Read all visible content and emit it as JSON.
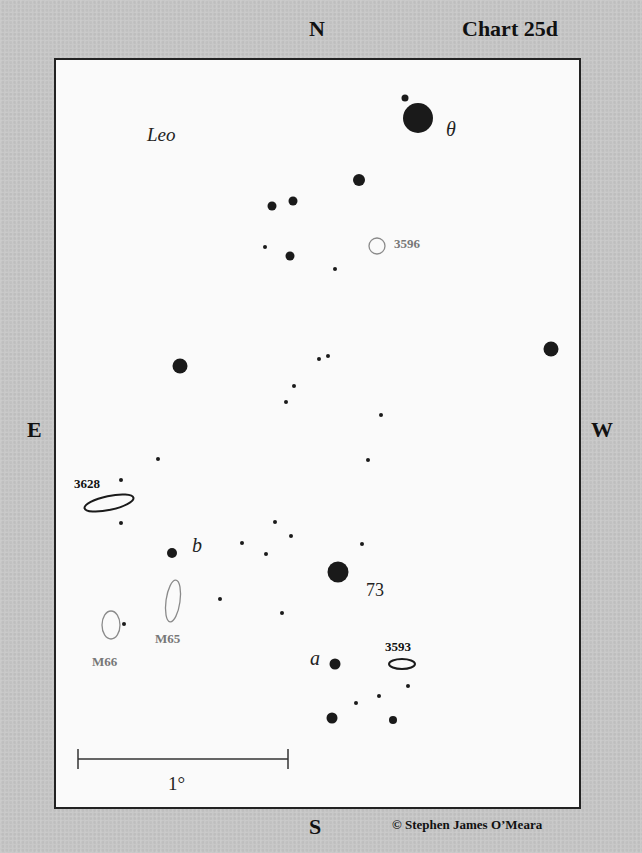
{
  "header": {
    "direction_north": "N",
    "chart_title": "Chart 25d"
  },
  "sides": {
    "direction_east": "E",
    "direction_west": "W",
    "direction_south": "S"
  },
  "footer": {
    "copyright": "© Stephen James O’Meara"
  },
  "chart": {
    "constellation_label": "Leo",
    "scale_bar_label": "1°",
    "colors": {
      "star": "#1a1a1a",
      "bright_galaxy_outline": "#1a1a1a",
      "faint_object_outline": "#8a8a8a",
      "faint_label": "#777777",
      "background": "#fafafa",
      "outer_background": "#c8c8c8"
    },
    "star_labels": [
      {
        "id": "theta",
        "text": "θ",
        "x": 446,
        "y": 135
      },
      {
        "id": "73",
        "text": "73",
        "x": 366,
        "y": 597
      },
      {
        "id": "b",
        "text": "b",
        "x": 192,
        "y": 551
      },
      {
        "id": "a",
        "text": "a",
        "x": 310,
        "y": 664
      }
    ],
    "objects": [
      {
        "id": "NGC3596",
        "label": "3596",
        "type": "galaxy-faint",
        "cx": 375,
        "cy": 244,
        "rx": 8,
        "ry": 8,
        "rotate": 0,
        "label_x": 394,
        "label_y": 248
      },
      {
        "id": "NGC3628",
        "label": "3628",
        "type": "galaxy-bright",
        "cx": 107,
        "cy": 501,
        "rx": 25,
        "ry": 7,
        "rotate": -12,
        "label_x": 74,
        "label_y": 488
      },
      {
        "id": "M65",
        "label": "M65",
        "type": "galaxy-faint",
        "cx": 171,
        "cy": 599,
        "rx": 7,
        "ry": 21,
        "rotate": 8,
        "label_x": 155,
        "label_y": 643
      },
      {
        "id": "M66",
        "label": "M66",
        "type": "galaxy-faint",
        "cx": 109,
        "cy": 623,
        "rx": 9,
        "ry": 14,
        "rotate": 0,
        "label_x": 92,
        "label_y": 666
      },
      {
        "id": "NGC3593",
        "label": "3593",
        "type": "galaxy-bright",
        "cx": 400,
        "cy": 662,
        "rx": 13,
        "ry": 5,
        "rotate": 0,
        "label_x": 385,
        "label_y": 651
      }
    ],
    "stars": [
      {
        "x": 416,
        "y": 116,
        "r": 15
      },
      {
        "x": 403,
        "y": 96,
        "r": 3.5
      },
      {
        "x": 357,
        "y": 178,
        "r": 6
      },
      {
        "x": 270,
        "y": 204,
        "r": 4.5
      },
      {
        "x": 291,
        "y": 199,
        "r": 4.5
      },
      {
        "x": 288,
        "y": 254,
        "r": 4.5
      },
      {
        "x": 263,
        "y": 245,
        "r": 2
      },
      {
        "x": 333,
        "y": 267,
        "r": 2
      },
      {
        "x": 178,
        "y": 364,
        "r": 7.5
      },
      {
        "x": 549,
        "y": 347,
        "r": 7.5
      },
      {
        "x": 317,
        "y": 357,
        "r": 2
      },
      {
        "x": 326,
        "y": 354,
        "r": 2
      },
      {
        "x": 292,
        "y": 384,
        "r": 2
      },
      {
        "x": 284,
        "y": 400,
        "r": 2
      },
      {
        "x": 379,
        "y": 413,
        "r": 2
      },
      {
        "x": 366,
        "y": 458,
        "r": 2
      },
      {
        "x": 156,
        "y": 457,
        "r": 2
      },
      {
        "x": 119,
        "y": 478,
        "r": 2
      },
      {
        "x": 119,
        "y": 521,
        "r": 2
      },
      {
        "x": 170,
        "y": 551,
        "r": 5
      },
      {
        "x": 273,
        "y": 520,
        "r": 2
      },
      {
        "x": 289,
        "y": 534,
        "r": 2
      },
      {
        "x": 240,
        "y": 541,
        "r": 2
      },
      {
        "x": 264,
        "y": 552,
        "r": 2
      },
      {
        "x": 360,
        "y": 542,
        "r": 2
      },
      {
        "x": 336,
        "y": 570,
        "r": 10.5
      },
      {
        "x": 218,
        "y": 597,
        "r": 2
      },
      {
        "x": 280,
        "y": 611,
        "r": 2
      },
      {
        "x": 122,
        "y": 622,
        "r": 2
      },
      {
        "x": 333,
        "y": 662,
        "r": 5.5
      },
      {
        "x": 406,
        "y": 684,
        "r": 2
      },
      {
        "x": 377,
        "y": 694,
        "r": 2
      },
      {
        "x": 354,
        "y": 701,
        "r": 2
      },
      {
        "x": 330,
        "y": 716,
        "r": 5.5
      },
      {
        "x": 391,
        "y": 718,
        "r": 4
      }
    ],
    "scale_bar": {
      "x1": 76,
      "x2": 286,
      "y": 757,
      "tick_half": 10,
      "label_x": 180,
      "label_y": 792
    }
  }
}
